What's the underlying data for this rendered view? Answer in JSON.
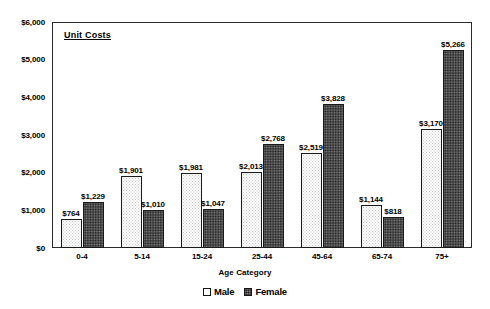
{
  "chart_data": {
    "type": "bar",
    "title": "Unit Costs",
    "xlabel": "Age Category",
    "ylabel": "",
    "ylim": [
      0,
      6000
    ],
    "grid": false,
    "legend_position": "bottom",
    "categories": [
      "0-4",
      "5-14",
      "15-24",
      "25-44",
      "45-64",
      "65-74",
      "75+"
    ],
    "ytick_labels": [
      "$6,000",
      "$5,000",
      "$4,000",
      "$3,000",
      "$2,000",
      "$1,000",
      "$0"
    ],
    "ytick_values": [
      6000,
      5000,
      4000,
      3000,
      2000,
      1000,
      0
    ],
    "series": [
      {
        "name": "Male",
        "values": [
          764,
          1901,
          1981,
          2013,
          2519,
          1144,
          3170
        ],
        "labels": [
          "$764",
          "$1,901",
          "$1,981",
          "$2,013",
          "$2,519",
          "$1,144",
          "$3,170"
        ]
      },
      {
        "name": "Female",
        "values": [
          1229,
          1010,
          1047,
          2768,
          3828,
          818,
          5266
        ],
        "labels": [
          "$1,229",
          "$1,010",
          "$1,047",
          "$2,768",
          "$3,828",
          "$818",
          "$5,266"
        ]
      }
    ]
  },
  "legend": {
    "items": [
      {
        "label": "Male",
        "swatch": "male-swatch"
      },
      {
        "label": "Female",
        "swatch": "female-swatch"
      }
    ]
  }
}
